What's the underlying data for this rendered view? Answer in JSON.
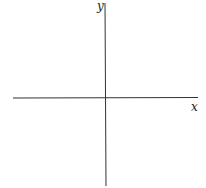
{
  "diagram": {
    "type": "coordinate-axes",
    "x_axis_label": "x",
    "y_axis_label": "y",
    "colors": {
      "axis": "#333333",
      "background": "#ffffff"
    }
  }
}
